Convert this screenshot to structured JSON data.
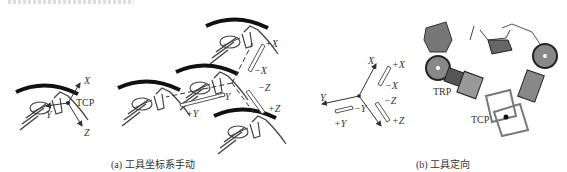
{
  "figure": {
    "panel_a": {
      "caption": "(a) 工具坐标系手动",
      "left_diagram": {
        "point_label": "TCP",
        "axes": [
          "X",
          "Y",
          "Z"
        ]
      },
      "right_diagram": {
        "move_labels": {
          "plus_x": "+X",
          "minus_x": "−X",
          "plus_y": "+Y",
          "minus_y": "−Y",
          "plus_z": "+Z",
          "minus_z": "−Z"
        }
      }
    },
    "triad": {
      "axes": [
        "X",
        "Y",
        "Z"
      ],
      "move_labels": {
        "plus_x": "+X",
        "minus_x": "−X",
        "plus_y": "+Y",
        "minus_y": "−Y",
        "plus_z": "+Z",
        "minus_z": "−Z"
      }
    },
    "panel_b": {
      "caption": "(b) 工具定向",
      "labels": {
        "trp": "TRP",
        "tcp": "TCP"
      }
    }
  }
}
